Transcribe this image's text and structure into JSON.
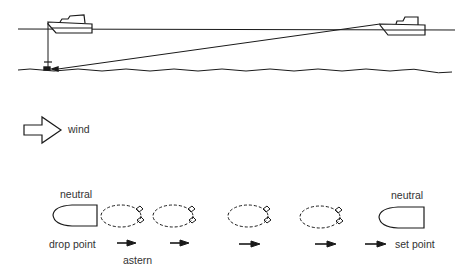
{
  "diagram": {
    "top_scene": {
      "description": "Boat drops anchor at drop point, then reverses with wind to set point, paying out anchor rode"
    },
    "wind": {
      "label": "wind",
      "icon": "right-arrow-outline-icon"
    },
    "sequence": {
      "start_state_label": "neutral",
      "start_position_label": "drop point",
      "motion_label": "astern",
      "end_state_label": "neutral",
      "end_position_label": "set point",
      "intermediate_steps": 4,
      "arrows": 5
    },
    "colors": {
      "line": "#1a1a1a",
      "text": "#333333",
      "background": "#ffffff"
    }
  }
}
